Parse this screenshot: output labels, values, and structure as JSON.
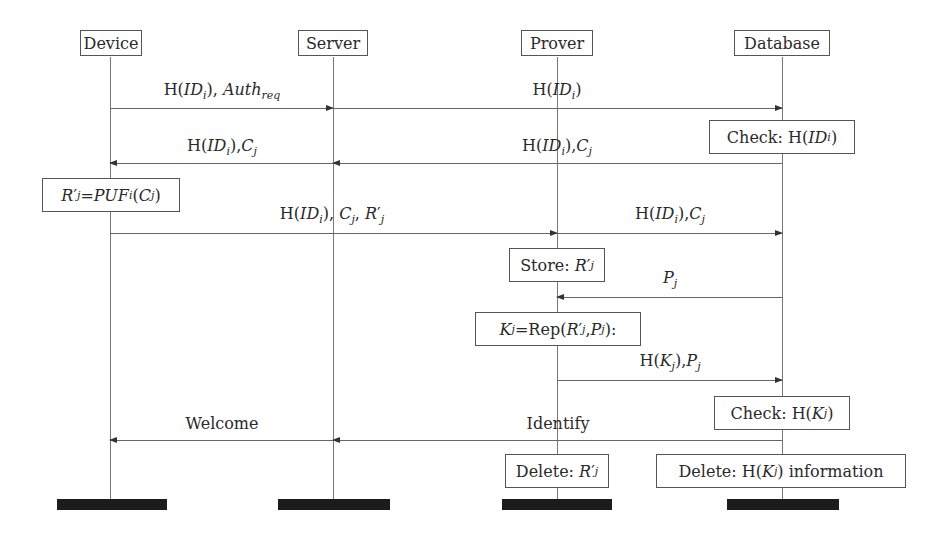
{
  "diagram": {
    "type": "sequence",
    "actors": [
      {
        "name": "Device",
        "x": 110
      },
      {
        "name": "Server",
        "x": 333
      },
      {
        "name": "Prover",
        "x": 557
      },
      {
        "name": "Database",
        "x": 782
      }
    ],
    "messages": [
      {
        "id": "m1",
        "label": "H(ID_i), Auth_req",
        "from": "Device",
        "to": "Server"
      },
      {
        "id": "m2",
        "label": "H(ID_i)",
        "from": "Server",
        "to": "Database"
      },
      {
        "id": "m3",
        "label": "H(ID_i),C_j",
        "from": "Database",
        "to": "Server"
      },
      {
        "id": "m4",
        "label": "H(ID_i),C_j",
        "from": "Server",
        "to": "Device"
      },
      {
        "id": "m5",
        "label": "H(ID_i), C_j, R'_j",
        "from": "Device",
        "to": "Prover"
      },
      {
        "id": "m6",
        "label": "H(ID_i),C_j",
        "from": "Prover",
        "to": "Database"
      },
      {
        "id": "m7",
        "label": "P_j",
        "from": "Database",
        "to": "Prover"
      },
      {
        "id": "m8",
        "label": "H(K_j),P_j",
        "from": "Prover",
        "to": "Database"
      },
      {
        "id": "m9",
        "label": "Identify",
        "from": "Database",
        "to": "Server"
      },
      {
        "id": "m10",
        "label": "Welcome",
        "from": "Server",
        "to": "Device"
      }
    ],
    "notes": [
      {
        "id": "n1",
        "actor": "Database",
        "text": "Check: H(ID_i)"
      },
      {
        "id": "n2",
        "actor": "Device",
        "text": "R'_j=PUF_i(C_j)"
      },
      {
        "id": "n3",
        "actor": "Prover",
        "text": "Store: R'_j"
      },
      {
        "id": "n4",
        "actor": "Prover",
        "text": "K_j=Rep(R'_j,P_j):"
      },
      {
        "id": "n5",
        "actor": "Database",
        "text": "Check: H(K_j)"
      },
      {
        "id": "n6",
        "actor": "Prover",
        "text": "Delete: R'_j"
      },
      {
        "id": "n7",
        "actor": "Database",
        "text": "Delete: H(K_j) information"
      }
    ],
    "labels": {
      "device": "Device",
      "server": "Server",
      "prover": "Prover",
      "database": "Database",
      "welcome": "Welcome",
      "identify": "Identify",
      "check": "Check:",
      "store": "Store:",
      "delete": "Delete:",
      "information": "information",
      "rep": "Rep",
      "auth": "Auth",
      "req": "req",
      "puf": "PUF",
      "h": "H"
    }
  }
}
